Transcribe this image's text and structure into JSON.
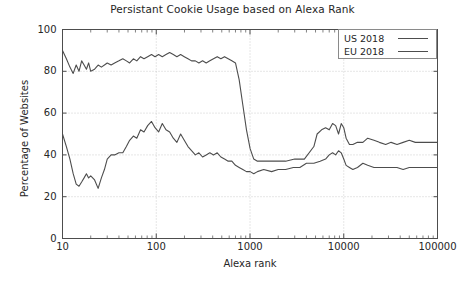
{
  "chart_data": {
    "type": "line",
    "title": "Persistant Cookie Usage based on Alexa Rank",
    "xlabel": "Alexa rank",
    "ylabel": "Percentage of Websites",
    "xscale": "log",
    "xlim": [
      10,
      100000
    ],
    "ylim": [
      0,
      100
    ],
    "grid": true,
    "legend_position": "top-right",
    "xticks": [
      "10",
      "100",
      "1000",
      "10000",
      "100000"
    ],
    "xtick_values": [
      10,
      100,
      1000,
      10000,
      100000
    ],
    "yticks": [
      "0",
      "20",
      "40",
      "60",
      "80",
      "100"
    ],
    "ytick_values": [
      0,
      20,
      40,
      60,
      80,
      100
    ],
    "series": [
      {
        "name": "US 2018",
        "color": "#4d4d4d",
        "x": [
          10,
          11,
          12,
          13,
          14,
          15,
          16,
          17,
          18,
          19,
          20,
          22,
          24,
          26,
          28,
          30,
          33,
          36,
          40,
          44,
          48,
          52,
          57,
          62,
          68,
          74,
          81,
          89,
          97,
          106,
          116,
          127,
          139,
          152,
          166,
          182,
          199,
          218,
          238,
          261,
          285,
          312,
          341,
          373,
          408,
          447,
          489,
          535,
          585,
          640,
          700,
          766,
          838,
          917,
          1003,
          1097,
          1200,
          1500,
          1900,
          2400,
          3000,
          3800,
          4800,
          5200,
          5800,
          6400,
          7000,
          7600,
          8200,
          8800,
          9400,
          10000,
          10600,
          11500,
          12500,
          14000,
          16000,
          18000,
          21000,
          24000,
          28000,
          32000,
          37000,
          43000,
          50000,
          58000,
          67000,
          78000,
          90000,
          100000
        ],
        "y": [
          90,
          86,
          82,
          79,
          83,
          80,
          85,
          83,
          81,
          84,
          80,
          81,
          83,
          82,
          83,
          84,
          83,
          84,
          85,
          86,
          85,
          84,
          86,
          85,
          87,
          86,
          87,
          88,
          87,
          88,
          87,
          88,
          89,
          88,
          87,
          88,
          87,
          86,
          85,
          85,
          84,
          85,
          84,
          85,
          86,
          87,
          86,
          87,
          86,
          85,
          84,
          76,
          64,
          52,
          43,
          38,
          37,
          37,
          37,
          37,
          38,
          38,
          44,
          50,
          52,
          53,
          52,
          55,
          54,
          50,
          55,
          53,
          48,
          45,
          45,
          46,
          46,
          48,
          47,
          46,
          45,
          46,
          45,
          46,
          47,
          46,
          46,
          46,
          46,
          46
        ]
      },
      {
        "name": "EU 2018",
        "color": "#4d4d4d",
        "x": [
          10,
          11,
          12,
          13,
          14,
          15,
          16,
          17,
          18,
          19,
          20,
          22,
          24,
          26,
          28,
          30,
          33,
          36,
          40,
          44,
          48,
          52,
          57,
          62,
          68,
          74,
          81,
          89,
          97,
          106,
          116,
          127,
          139,
          152,
          166,
          182,
          199,
          218,
          238,
          261,
          285,
          312,
          341,
          373,
          408,
          447,
          489,
          535,
          585,
          640,
          700,
          766,
          838,
          917,
          1003,
          1097,
          1200,
          1400,
          1700,
          2000,
          2400,
          2900,
          3400,
          4000,
          4800,
          5600,
          6400,
          7000,
          7600,
          8200,
          8800,
          9400,
          10000,
          10600,
          11500,
          12500,
          14000,
          16000,
          18000,
          21000,
          24000,
          28000,
          32000,
          37000,
          43000,
          50000,
          58000,
          67000,
          78000,
          90000,
          100000
        ],
        "y": [
          50,
          44,
          38,
          31,
          26,
          25,
          27,
          29,
          31,
          29,
          30,
          28,
          24,
          29,
          33,
          38,
          40,
          40,
          41,
          41,
          44,
          47,
          49,
          48,
          52,
          51,
          54,
          56,
          53,
          51,
          55,
          52,
          51,
          48,
          46,
          50,
          47,
          44,
          42,
          40,
          41,
          39,
          40,
          41,
          40,
          41,
          39,
          38,
          37,
          37,
          35,
          34,
          33,
          32,
          32,
          31,
          32,
          33,
          32,
          33,
          33,
          34,
          34,
          36,
          36,
          37,
          38,
          40,
          41,
          40,
          42,
          41,
          38,
          35,
          34,
          33,
          34,
          36,
          35,
          34,
          34,
          34,
          34,
          34,
          33,
          34,
          34,
          34,
          34,
          34,
          34
        ]
      }
    ]
  },
  "legend": {
    "items": [
      {
        "label": "US 2018"
      },
      {
        "label": "EU 2018"
      }
    ]
  }
}
